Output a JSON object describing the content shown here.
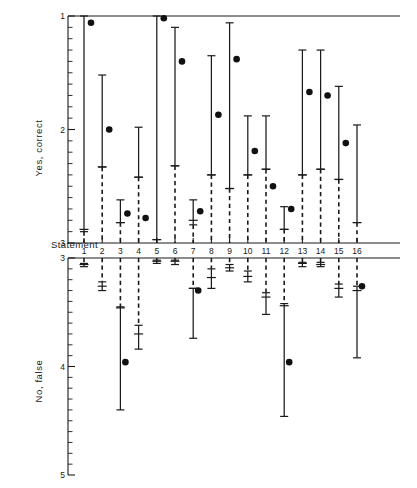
{
  "chart_data": {
    "type": "scatter",
    "title": "",
    "subtitle": "",
    "xlabel": "Statement",
    "x_tick_labels": [
      "1",
      "2",
      "3",
      "4",
      "5",
      "6",
      "7",
      "8",
      "9",
      "10",
      "11",
      "12",
      "13",
      "14",
      "15",
      "16"
    ],
    "x": [
      1,
      2,
      3,
      4,
      5,
      6,
      7,
      8,
      9,
      10,
      11,
      12,
      13,
      14,
      15,
      16
    ],
    "grid": false,
    "legend": null,
    "panels": [
      {
        "name": "upper",
        "ylabel": "Yes, correct",
        "ylim": [
          1,
          3
        ],
        "y_inverted": true,
        "y_tick_labels": [
          "1",
          "2",
          "3"
        ],
        "y_major_ticks": [
          1,
          2,
          3
        ],
        "minor_ticks_per_major": 10,
        "series": [
          {
            "name": "ranges",
            "description": "solid range with median cross tick, dashed extension to axis floor, filled dot = mean rating",
            "points": [
              {
                "x": 1,
                "range_top": 1.0,
                "range_bottom": 2.9,
                "median": 2.88,
                "dashed_from": 2.9,
                "dashed_to": 3.0,
                "dot": 1.06
              },
              {
                "x": 2,
                "range_top": 1.52,
                "range_bottom": 2.33,
                "median": 2.33,
                "dashed_from": 2.33,
                "dashed_to": 3.0,
                "dot": 2.0
              },
              {
                "x": 3,
                "range_top": 2.62,
                "range_bottom": 2.82,
                "median": 2.82,
                "dashed_from": 2.82,
                "dashed_to": 3.0,
                "dot": 2.74
              },
              {
                "x": 4,
                "range_top": 1.98,
                "range_bottom": 2.42,
                "median": 2.42,
                "dashed_from": 2.42,
                "dashed_to": 3.0,
                "dot": 2.78
              },
              {
                "x": 5,
                "range_top": 1.0,
                "range_bottom": 2.97,
                "median": 2.97,
                "dashed_from": 2.97,
                "dashed_to": 3.0,
                "dot": 1.02
              },
              {
                "x": 6,
                "range_top": 1.1,
                "range_bottom": 2.32,
                "median": 2.32,
                "dashed_from": 2.32,
                "dashed_to": 3.0,
                "dot": 1.4
              },
              {
                "x": 7,
                "range_top": 2.62,
                "range_bottom": 2.84,
                "median": 2.8,
                "dashed_from": 2.84,
                "dashed_to": 3.0,
                "dot": 2.72
              },
              {
                "x": 8,
                "range_top": 1.35,
                "range_bottom": 2.4,
                "median": 2.4,
                "dashed_from": 2.4,
                "dashed_to": 3.0,
                "dot": 1.87
              },
              {
                "x": 9,
                "range_top": 1.06,
                "range_bottom": 2.52,
                "median": 2.52,
                "dashed_from": 2.52,
                "dashed_to": 3.0,
                "dot": 1.38
              },
              {
                "x": 10,
                "range_top": 1.88,
                "range_bottom": 2.4,
                "median": 2.4,
                "dashed_from": 2.4,
                "dashed_to": 3.0,
                "dot": 2.19
              },
              {
                "x": 11,
                "range_top": 1.88,
                "range_bottom": 2.35,
                "median": 2.35,
                "dashed_from": 2.35,
                "dashed_to": 3.0,
                "dot": 2.5
              },
              {
                "x": 12,
                "range_top": 2.68,
                "range_bottom": 2.88,
                "median": 2.88,
                "dashed_from": 2.88,
                "dashed_to": 3.0,
                "dot": 2.7
              },
              {
                "x": 13,
                "range_top": 1.3,
                "range_bottom": 2.4,
                "median": 2.4,
                "dashed_from": 2.4,
                "dashed_to": 3.0,
                "dot": 1.67
              },
              {
                "x": 14,
                "range_top": 1.3,
                "range_bottom": 2.35,
                "median": 2.35,
                "dashed_from": 2.35,
                "dashed_to": 3.0,
                "dot": 1.7
              },
              {
                "x": 15,
                "range_top": 1.62,
                "range_bottom": 2.44,
                "median": 2.44,
                "dashed_from": 2.44,
                "dashed_to": 3.0,
                "dot": 2.12
              },
              {
                "x": 16,
                "range_top": 1.96,
                "range_bottom": 2.82,
                "median": 2.82,
                "dashed_from": 2.82,
                "dashed_to": 3.0,
                "dot": null
              }
            ]
          }
        ]
      },
      {
        "name": "lower",
        "ylabel": "No, false",
        "ylim": [
          3,
          5
        ],
        "y_inverted": true,
        "y_tick_labels": [
          "3",
          "4",
          "5"
        ],
        "y_major_ticks": [
          3,
          4,
          5
        ],
        "minor_ticks_per_major": 10,
        "series": [
          {
            "name": "ranges",
            "description": "dashed extension from axis ceiling, solid range with median cross tick, filled dot = mean rating",
            "points": [
              {
                "x": 1,
                "dashed_from": 3.0,
                "dashed_to": 3.05,
                "range_top": 3.05,
                "range_bottom": 3.08,
                "median": 3.06,
                "dot": null
              },
              {
                "x": 2,
                "dashed_from": 3.0,
                "dashed_to": 3.22,
                "range_top": 3.22,
                "range_bottom": 3.3,
                "median": 3.26,
                "dot": null
              },
              {
                "x": 3,
                "dashed_from": 3.0,
                "dashed_to": 3.45,
                "range_top": 3.45,
                "range_bottom": 4.4,
                "median": 3.46,
                "dot": 3.96
              },
              {
                "x": 4,
                "dashed_from": 3.0,
                "dashed_to": 3.62,
                "range_top": 3.62,
                "range_bottom": 3.84,
                "median": 3.7,
                "dot": null
              },
              {
                "x": 5,
                "dashed_from": 3.0,
                "dashed_to": 3.02,
                "range_top": 3.02,
                "range_bottom": 3.05,
                "median": 3.03,
                "dot": null
              },
              {
                "x": 6,
                "dashed_from": 3.0,
                "dashed_to": 3.02,
                "range_top": 3.02,
                "range_bottom": 3.06,
                "median": 3.03,
                "dot": null
              },
              {
                "x": 7,
                "dashed_from": 3.0,
                "dashed_to": 3.28,
                "range_top": 3.28,
                "range_bottom": 3.74,
                "median": 3.28,
                "dot": 3.3
              },
              {
                "x": 8,
                "dashed_from": 3.0,
                "dashed_to": 3.1,
                "range_top": 3.1,
                "range_bottom": 3.28,
                "median": 3.18,
                "dot": null
              },
              {
                "x": 9,
                "dashed_from": 3.0,
                "dashed_to": 3.06,
                "range_top": 3.06,
                "range_bottom": 3.12,
                "median": 3.09,
                "dot": null
              },
              {
                "x": 10,
                "dashed_from": 3.0,
                "dashed_to": 3.12,
                "range_top": 3.12,
                "range_bottom": 3.22,
                "median": 3.17,
                "dot": null
              },
              {
                "x": 11,
                "dashed_from": 3.0,
                "dashed_to": 3.32,
                "range_top": 3.32,
                "range_bottom": 3.52,
                "median": 3.36,
                "dot": null
              },
              {
                "x": 12,
                "dashed_from": 3.0,
                "dashed_to": 3.42,
                "range_top": 3.42,
                "range_bottom": 4.46,
                "median": 3.44,
                "dot": 3.96
              },
              {
                "x": 13,
                "dashed_from": 3.0,
                "dashed_to": 3.04,
                "range_top": 3.04,
                "range_bottom": 3.08,
                "median": 3.05,
                "dot": null
              },
              {
                "x": 14,
                "dashed_from": 3.0,
                "dashed_to": 3.04,
                "range_top": 3.04,
                "range_bottom": 3.08,
                "median": 3.06,
                "dot": null
              },
              {
                "x": 15,
                "dashed_from": 3.0,
                "dashed_to": 3.24,
                "range_top": 3.24,
                "range_bottom": 3.36,
                "median": 3.28,
                "dot": null
              },
              {
                "x": 16,
                "dashed_from": 3.0,
                "dashed_to": 3.26,
                "range_top": 3.26,
                "range_bottom": 3.92,
                "median": 3.3,
                "dot": 3.26
              }
            ]
          }
        ]
      }
    ]
  }
}
